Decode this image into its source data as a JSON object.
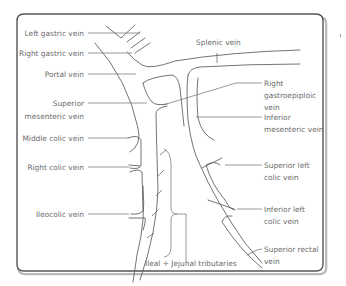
{
  "figure": {
    "labels_left": [
      {
        "id": "left-gastric",
        "text": [
          "Left gastric vein"
        ]
      },
      {
        "id": "right-gastric",
        "text": [
          "Right gastric vein"
        ]
      },
      {
        "id": "portal",
        "text": [
          "Portal vein"
        ]
      },
      {
        "id": "superior-mesenteric",
        "text": [
          "Superior",
          "mesenteric vein"
        ]
      },
      {
        "id": "middle-colic",
        "text": [
          "Middle colic vein"
        ]
      },
      {
        "id": "right-colic",
        "text": [
          "Right colic vein"
        ]
      },
      {
        "id": "ileocolic",
        "text": [
          "Ileocolic vein"
        ]
      }
    ],
    "labels_right": [
      {
        "id": "splenic",
        "text": [
          "Splenic vein"
        ]
      },
      {
        "id": "right-gastroepiploic",
        "text": [
          "Right",
          "gastroepiploic",
          "vein"
        ]
      },
      {
        "id": "inferior-mesenteric",
        "text": [
          "Inferior",
          "mesenteric vein"
        ]
      },
      {
        "id": "superior-left-colic",
        "text": [
          "Superior left",
          "colic vein"
        ]
      },
      {
        "id": "inferior-left-colic",
        "text": [
          "Inferior left",
          "colic vein"
        ]
      },
      {
        "id": "superior-rectal",
        "text": [
          "Superior rectal",
          "vein"
        ]
      }
    ],
    "labels_bottom": [
      {
        "id": "ileal-jejunal",
        "text": [
          "Ileal + Jejunal tributaries"
        ]
      }
    ],
    "colors": {
      "line": "#5a5a5a",
      "text": "#6a6a6a",
      "frame": "#555555"
    }
  }
}
